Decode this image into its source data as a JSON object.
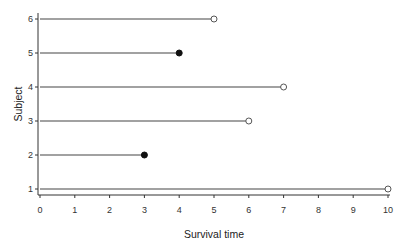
{
  "chart_data": {
    "type": "lollipop-survival",
    "title": "",
    "xlabel": "Survival time",
    "ylabel": "Subject",
    "xlim": [
      0,
      10
    ],
    "ylim": [
      1,
      6
    ],
    "x_ticks": [
      "0",
      "1",
      "2",
      "3",
      "4",
      "5",
      "6",
      "7",
      "8",
      "9",
      "10"
    ],
    "y_ticks": [
      "1",
      "2",
      "3",
      "4",
      "5",
      "6"
    ],
    "grid": false,
    "legend": null,
    "marker_legend": {
      "filled": "event (death)",
      "open": "censored"
    },
    "subjects": [
      {
        "subject": 1,
        "time": 10,
        "status": "censored"
      },
      {
        "subject": 2,
        "time": 3,
        "status": "event"
      },
      {
        "subject": 3,
        "time": 6,
        "status": "censored"
      },
      {
        "subject": 4,
        "time": 7,
        "status": "censored"
      },
      {
        "subject": 5,
        "time": 4,
        "status": "event"
      },
      {
        "subject": 6,
        "time": 5,
        "status": "censored"
      }
    ]
  },
  "colors": {
    "line": "#444444",
    "axis": "#333333",
    "marker_fill": "#111111",
    "open_marker_fill": "#ffffff"
  }
}
